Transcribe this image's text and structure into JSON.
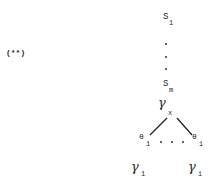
{
  "label": "(**)",
  "nodes": {
    "s_top": {
      "base": "S",
      "sub": "1"
    },
    "s_bottom": {
      "base": "S",
      "sub": "m"
    },
    "gamma_x": {
      "base": "γ",
      "sub": "x"
    },
    "theta_left": {
      "base": "θ",
      "sub": "1"
    },
    "theta_right": {
      "base": "θ",
      "sub": "i"
    },
    "gamma_left": {
      "base": "γ",
      "sub": "1"
    },
    "gamma_right": {
      "base": "γ",
      "sub": "i"
    }
  },
  "ellipsis": ". . ."
}
